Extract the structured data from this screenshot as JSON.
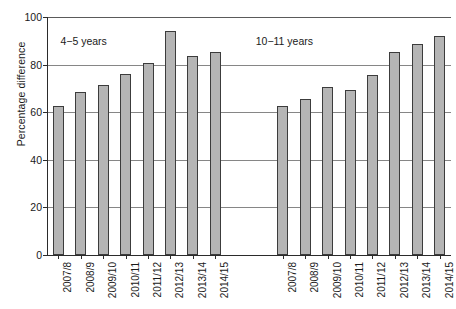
{
  "chart_data": {
    "type": "bar",
    "title": "",
    "xlabel": "",
    "ylabel": "Percentage difference",
    "ylim": [
      0,
      100
    ],
    "yticks": [
      0,
      20,
      40,
      60,
      80,
      100
    ],
    "ytick_labels": [
      "0",
      "20",
      "40",
      "60",
      "80",
      "100"
    ],
    "grid": true,
    "legend": "none",
    "bar_color": "#b5b5b5",
    "bar_border_color": "#3c3c3c",
    "groups": [
      {
        "name": "4−5 years",
        "annotation": "4−5 years",
        "categories": [
          "2007/8",
          "2008/9",
          "2009/10",
          "2010/11",
          "2011/12",
          "2012/13",
          "2013/14",
          "2014/15"
        ],
        "values": [
          62.5,
          68.5,
          71.5,
          76,
          80.5,
          94,
          83.5,
          85.5
        ]
      },
      {
        "name": "10−11 years",
        "annotation": "10−11 years",
        "categories": [
          "2007/8",
          "2008/9",
          "2009/10",
          "2010/11",
          "2011/12",
          "2012/13",
          "2013/14",
          "2014/15"
        ],
        "values": [
          62.5,
          65.5,
          70.5,
          69.5,
          75.5,
          85.5,
          88.5,
          92
        ]
      }
    ],
    "categories": [
      "2007/8",
      "2008/9",
      "2009/10",
      "2010/11",
      "2011/12",
      "2012/13",
      "2013/14",
      "2014/15",
      "2007/8",
      "2008/9",
      "2009/10",
      "2010/11",
      "2011/12",
      "2012/13",
      "2013/14",
      "2014/15"
    ],
    "values": [
      62.5,
      68.5,
      71.5,
      76,
      80.5,
      94,
      83.5,
      85.5,
      62.5,
      65.5,
      70.5,
      69.5,
      75.5,
      85.5,
      88.5,
      92
    ]
  }
}
